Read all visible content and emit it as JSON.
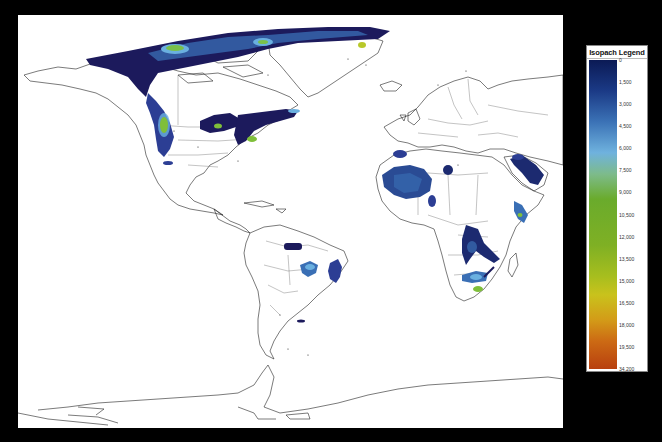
{
  "map": {
    "title": "World isopach map",
    "projection_label": "",
    "regions": [
      {
        "name": "arctic-alaska-sverdrup",
        "colors": [
          "#1c1a5c",
          "#2c3e94",
          "#5aa6d8",
          "#79c04a"
        ]
      },
      {
        "name": "western-canada",
        "colors": [
          "#2c3e94",
          "#6ab0e0",
          "#7fbf3a"
        ]
      },
      {
        "name": "midcontinent-usa",
        "colors": [
          "#1c1a5c",
          "#2c3e94",
          "#7fbf3a"
        ]
      },
      {
        "name": "appalachian",
        "colors": [
          "#1c1a5c",
          "#3a6fb5",
          "#7fbf3a"
        ]
      },
      {
        "name": "greenland-east",
        "colors": [
          "#2c3e94",
          "#b8c82a"
        ]
      },
      {
        "name": "west-africa-taoudeni",
        "colors": [
          "#2a4b94",
          "#3a6fb5"
        ]
      },
      {
        "name": "north-africa",
        "colors": [
          "#2c3e94"
        ]
      },
      {
        "name": "arabia-east-africa",
        "colors": [
          "#1c2a70",
          "#3a6fb5",
          "#7fbf3a"
        ]
      },
      {
        "name": "congo-basin",
        "colors": [
          "#1c2a70",
          "#3a6fb5"
        ]
      },
      {
        "name": "southern-africa",
        "colors": [
          "#3a6fb5",
          "#6ab0e0",
          "#7fbf3a"
        ]
      },
      {
        "name": "amazon",
        "colors": [
          "#1c1a5c"
        ]
      },
      {
        "name": "parana",
        "colors": [
          "#3a6fb5",
          "#6ab0e0"
        ]
      },
      {
        "name": "sao-francisco",
        "colors": [
          "#2c3e94"
        ]
      }
    ]
  },
  "legend": {
    "title": "Isopach Legend",
    "ticks": [
      "0",
      "1,500",
      "3,000",
      "4,500",
      "6,000",
      "7,500",
      "9,000",
      "10,500",
      "12,000",
      "13,500",
      "15,000",
      "16,500",
      "18,000",
      "19,500",
      "34,200"
    ],
    "min": 0,
    "max": 34200,
    "color_low": "#0b1a55",
    "color_mid": "#6aab2c",
    "color_high": "#b8400f"
  }
}
